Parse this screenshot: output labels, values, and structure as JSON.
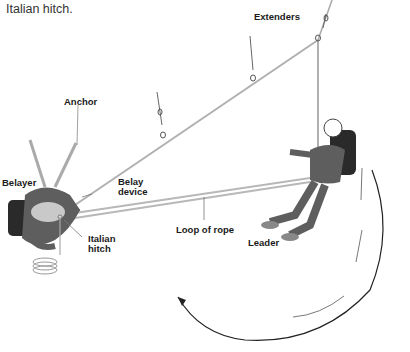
{
  "caption": "Italian hitch.",
  "labels": {
    "extenders": "Extenders",
    "anchor": "Anchor",
    "belayer": "Belayer",
    "belay_device_1": "Belay",
    "belay_device_2": "device",
    "italian_hitch_1": "Italian",
    "italian_hitch_2": "hitch",
    "loop_of_rope": "Loop of rope",
    "leader": "Leader"
  },
  "bottom_text_cut": "",
  "colors": {
    "rope": "#b5b5b5",
    "clothing": "#5e5e5e",
    "backpack": "#2a2a2a",
    "arrow": "#222222",
    "text": "#1a1a1a"
  }
}
